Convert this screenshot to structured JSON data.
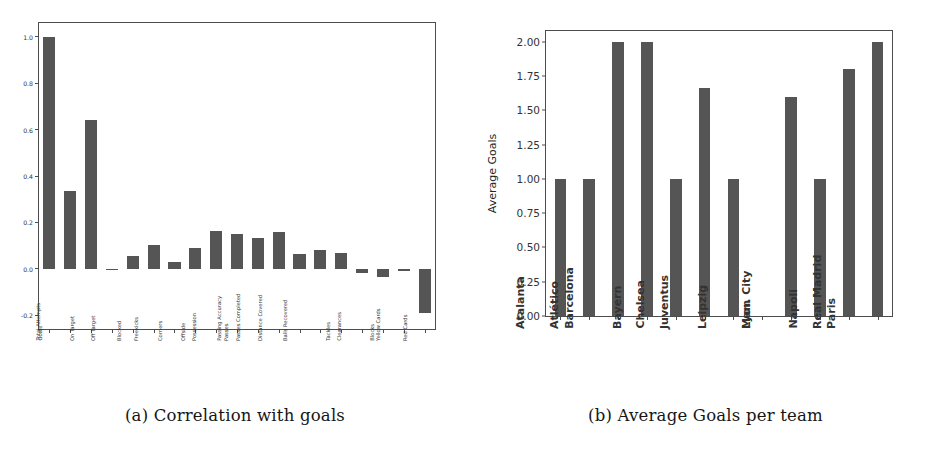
{
  "figure": {
    "background": "#ffffff",
    "bar_color": "#555555",
    "axis_color": "#4d4d4d",
    "text_color": "#333333"
  },
  "subfigures": [
    {
      "key": "a",
      "caption": "(a) Correlation with goals"
    },
    {
      "key": "b",
      "caption": "(b) Average Goals per team"
    }
  ],
  "chart_data": [
    {
      "type": "bar",
      "panel": "a",
      "title": "",
      "caption": "(a) Correlation with goals",
      "xlabel": "",
      "ylabel": "",
      "ylim": [
        -0.26,
        1.06
      ],
      "grid": false,
      "legend": "none",
      "yticks": [
        "1.0",
        "0.8",
        "0.6",
        "0.4",
        "0.2",
        "0.0",
        "-0.2"
      ],
      "ytick_values": [
        1.0,
        0.8,
        0.6,
        0.4,
        0.2,
        0.0,
        -0.2
      ],
      "categories": [
        "Goals",
        "Total Attempts",
        "On Target",
        "Off Target",
        "Blocked",
        "Freekicks",
        "Corners",
        "Offside",
        "Possession",
        "Passes",
        "Passing Accuracy",
        "Passes Completed",
        "Distance Covered",
        "Balls Recovered",
        "Tackles",
        "Clearances",
        "Blocks",
        "Yellow Cards",
        "Red Cards"
      ],
      "values": [
        1.0,
        0.335,
        0.64,
        -0.007,
        0.053,
        0.102,
        0.031,
        0.091,
        0.163,
        0.151,
        0.134,
        0.159,
        0.065,
        0.079,
        0.066,
        -0.017,
        -0.034,
        -0.011,
        -0.19
      ]
    },
    {
      "type": "bar",
      "panel": "b",
      "title": "",
      "caption": "(b) Average Goals per team",
      "xlabel": "",
      "ylabel": "Average Goals",
      "ylim": [
        0.0,
        2.08
      ],
      "grid": false,
      "legend": "none",
      "yticks": [
        "2.00",
        "1.75",
        "1.50",
        "1.25",
        "1.00",
        "0.75",
        "0.50",
        "0.25",
        "0.00"
      ],
      "ytick_values": [
        2.0,
        1.75,
        1.5,
        1.25,
        1.0,
        0.75,
        0.5,
        0.25,
        0.0
      ],
      "categories": [
        "Atalanta",
        "Atlético",
        "Barcelona",
        "Bayern",
        "Chelsea",
        "Juventus",
        "Leipzig",
        "Lyon",
        "Man. City",
        "Napoli",
        "Paris",
        "Real Madrid"
      ],
      "values": [
        1.0,
        1.0,
        2.0,
        2.0,
        1.0,
        1.666,
        1.0,
        0.0,
        1.6,
        1.0,
        1.8,
        2.0
      ]
    }
  ]
}
